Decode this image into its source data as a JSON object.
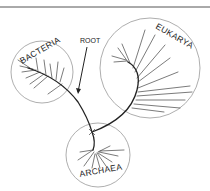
{
  "diagram": {
    "title_rule": true,
    "root_label": "ROOT",
    "domains": [
      {
        "name": "BACTERIA"
      },
      {
        "name": "EUKARYA"
      },
      {
        "name": "ARCHAEA"
      }
    ]
  }
}
